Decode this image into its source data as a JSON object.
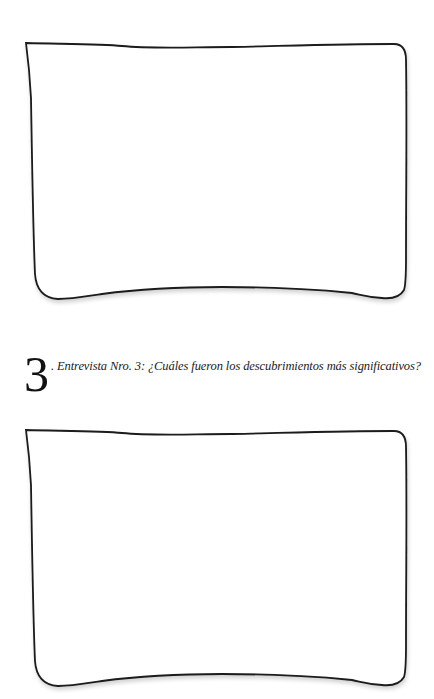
{
  "sections": [
    {
      "number": "",
      "question": "",
      "answer_box": "empty"
    },
    {
      "number": "3",
      "question": ". Entrevista Nro. 3: ¿Cuáles fueron los descubrimientos más significativos?",
      "answer_box": "empty"
    }
  ],
  "colors": {
    "background": "#ffffff",
    "stroke": "#1a1a1a"
  }
}
